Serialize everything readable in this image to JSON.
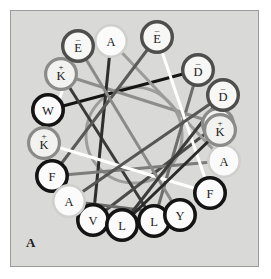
{
  "figure": {
    "type": "helical-wheel",
    "panel_label": "A",
    "background_color": "#d9d9d7",
    "panel_border_color": "#9a9a98",
    "page_background": "#ffffff"
  },
  "chart_data": {
    "type": "scatter",
    "title": "",
    "xlabel": "",
    "ylabel": "",
    "center": {
      "x": 134,
      "y": 135
    },
    "wheel_radius": 83,
    "inner_circle_radius": 48,
    "residue_radius": 17,
    "angle_step_deg": 100,
    "start_angle_deg": -130,
    "ring_styles": {
      "hydrophobic": {
        "stroke": "#141414",
        "width": 3.6,
        "fill": "#fbfbfb"
      },
      "basic": {
        "stroke": "#8b8b89",
        "width": 3.2,
        "fill": "#f2f2f0"
      },
      "acidic": {
        "stroke": "#4e4e4e",
        "width": 3.4,
        "fill": "#f7f7f5"
      },
      "small": {
        "stroke": "#cfcfcd",
        "width": 2.6,
        "fill": "#fbfbfb"
      }
    },
    "residues": [
      {
        "index": 1,
        "letter": "W",
        "charge": "",
        "style": "hydrophobic",
        "x": 48,
        "y": 110
      },
      {
        "index": 2,
        "letter": "D",
        "charge": "-",
        "style": "acidic",
        "x": 198,
        "y": 70
      },
      {
        "index": 3,
        "letter": "L",
        "charge": "",
        "style": "hydrophobic",
        "x": 154,
        "y": 221
      },
      {
        "index": 4,
        "letter": "K",
        "charge": "+",
        "style": "basic",
        "x": 61,
        "y": 74
      },
      {
        "index": 5,
        "letter": "K",
        "charge": "+",
        "style": "basic",
        "x": 218,
        "y": 124
      },
      {
        "index": 6,
        "letter": "V",
        "charge": "",
        "style": "hydrophobic",
        "x": 93,
        "y": 220
      },
      {
        "index": 7,
        "letter": "A",
        "charge": "",
        "style": "small",
        "x": 111,
        "y": 41
      },
      {
        "index": 8,
        "letter": "A",
        "charge": "",
        "style": "small",
        "x": 224,
        "y": 161
      },
      {
        "index": 9,
        "letter": "F",
        "charge": "",
        "style": "hydrophobic",
        "x": 52,
        "y": 176
      },
      {
        "index": 10,
        "letter": "E",
        "charge": "-",
        "style": "acidic",
        "x": 157,
        "y": 37
      },
      {
        "index": 11,
        "letter": "F",
        "charge": "",
        "style": "hydrophobic",
        "x": 210,
        "y": 193
      },
      {
        "index": 12,
        "letter": "K",
        "charge": "+",
        "style": "basic",
        "x": 44,
        "y": 143
      },
      {
        "index": 13,
        "letter": "E",
        "charge": "-",
        "style": "acidic",
        "x": 78,
        "y": 46
      },
      {
        "index": 14,
        "letter": "Y",
        "charge": "",
        "style": "hydrophobic",
        "x": 180,
        "y": 215
      },
      {
        "index": 15,
        "letter": "A",
        "charge": "",
        "style": "small",
        "x": 69,
        "y": 201
      },
      {
        "index": 16,
        "letter": "D",
        "charge": "-",
        "style": "acidic",
        "x": 223,
        "y": 95
      },
      {
        "index": 17,
        "letter": "L",
        "charge": "",
        "style": "hydrophobic",
        "x": 122,
        "y": 225
      },
      {
        "index": 18,
        "letter": "K",
        "charge": "+",
        "style": "basic",
        "x": 220,
        "y": 130
      }
    ],
    "sequence": "W D L K K V A A F E F K E Y A D L K",
    "connector_lines": [
      {
        "from": 1,
        "to": 2,
        "color": "#141414",
        "width": 3.0
      },
      {
        "from": 2,
        "to": 3,
        "color": "#6e6e6c",
        "width": 3.0
      },
      {
        "from": 3,
        "to": 4,
        "color": "#3a3a3a",
        "width": 3.0
      },
      {
        "from": 4,
        "to": 5,
        "color": "#8d8d8b",
        "width": 3.0
      },
      {
        "from": 5,
        "to": 6,
        "color": "#4a4a4a",
        "width": 3.0
      },
      {
        "from": 6,
        "to": 7,
        "color": "#2e2e2e",
        "width": 3.0
      },
      {
        "from": 7,
        "to": 8,
        "color": "#9b9b99",
        "width": 3.0
      },
      {
        "from": 8,
        "to": 9,
        "color": "#7c7c7a",
        "width": 3.0
      },
      {
        "from": 9,
        "to": 10,
        "color": "#5a5a58",
        "width": 3.0
      },
      {
        "from": 10,
        "to": 11,
        "color": "#ffffff",
        "width": 3.0
      },
      {
        "from": 11,
        "to": 12,
        "color": "#ffffff",
        "width": 3.0
      },
      {
        "from": 12,
        "to": 13,
        "color": "#ffffff",
        "width": 3.0
      },
      {
        "from": 13,
        "to": 14,
        "color": "#8a8a88",
        "width": 3.0
      },
      {
        "from": 14,
        "to": 15,
        "color": "#6a6a68",
        "width": 3.0
      },
      {
        "from": 15,
        "to": 16,
        "color": "#565654",
        "width": 3.0
      },
      {
        "from": 16,
        "to": 17,
        "color": "#3c3c3c",
        "width": 3.0
      },
      {
        "from": 17,
        "to": 18,
        "color": "#2a2a2a",
        "width": 3.0
      }
    ],
    "inner_circle": {
      "stroke": "#9d9d9b",
      "width": 3.0,
      "fill": "none"
    }
  }
}
